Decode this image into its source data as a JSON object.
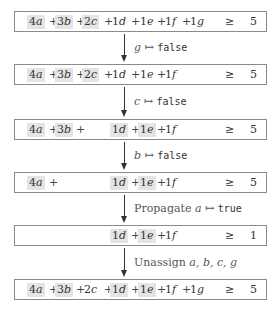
{
  "colors": {
    "highlight": "#e4e4e4",
    "border": "#8a8a8a"
  },
  "constraints": [
    {
      "terms": [
        {
          "coef": "4",
          "var": "a",
          "highlighted": true
        },
        {
          "coef": "3",
          "var": "b",
          "highlighted": true
        },
        {
          "coef": "2",
          "var": "c",
          "highlighted": true
        },
        {
          "coef": "1",
          "var": "d",
          "highlighted": false
        },
        {
          "coef": "1",
          "var": "e",
          "highlighted": false
        },
        {
          "coef": "1",
          "var": "f",
          "highlighted": false
        },
        {
          "coef": "1",
          "var": "g",
          "highlighted": false
        }
      ],
      "relation": "≥",
      "rhs": "5"
    },
    {
      "terms": [
        {
          "coef": "4",
          "var": "a",
          "highlighted": true
        },
        {
          "coef": "3",
          "var": "b",
          "highlighted": true
        },
        {
          "coef": "2",
          "var": "c",
          "highlighted": true
        },
        {
          "coef": "1",
          "var": "d",
          "highlighted": false
        },
        {
          "coef": "1",
          "var": "e",
          "highlighted": false
        },
        {
          "coef": "1",
          "var": "f",
          "highlighted": false
        }
      ],
      "relation": "≥",
      "rhs": "5"
    },
    {
      "terms": [
        {
          "coef": "4",
          "var": "a",
          "highlighted": true
        },
        {
          "coef": "3",
          "var": "b",
          "highlighted": true
        },
        {
          "coef": "1",
          "var": "d",
          "highlighted": true
        },
        {
          "coef": "1",
          "var": "e",
          "highlighted": true
        },
        {
          "coef": "1",
          "var": "f",
          "highlighted": false
        }
      ],
      "relation": "≥",
      "rhs": "5"
    },
    {
      "terms": [
        {
          "coef": "4",
          "var": "a",
          "highlighted": true
        },
        {
          "coef": "1",
          "var": "d",
          "highlighted": true
        },
        {
          "coef": "1",
          "var": "e",
          "highlighted": true
        },
        {
          "coef": "1",
          "var": "f",
          "highlighted": false
        }
      ],
      "relation": "≥",
      "rhs": "5"
    },
    {
      "terms": [
        {
          "coef": "1",
          "var": "d",
          "highlighted": true
        },
        {
          "coef": "1",
          "var": "e",
          "highlighted": true
        },
        {
          "coef": "1",
          "var": "f",
          "highlighted": false
        }
      ],
      "relation": "≥",
      "rhs": "1"
    },
    {
      "terms": [
        {
          "coef": "4",
          "var": "a",
          "highlighted": true
        },
        {
          "coef": "3",
          "var": "b",
          "highlighted": true
        },
        {
          "coef": "2",
          "var": "c",
          "highlighted": false
        },
        {
          "coef": "1",
          "var": "d",
          "highlighted": true
        },
        {
          "coef": "1",
          "var": "e",
          "highlighted": true
        },
        {
          "coef": "1",
          "var": "f",
          "highlighted": false
        },
        {
          "coef": "1",
          "var": "g",
          "highlighted": false
        }
      ],
      "relation": "≥",
      "rhs": "5"
    }
  ],
  "steps": [
    {
      "prefix": "",
      "var": "g",
      "mapsto": "↦",
      "value": "false"
    },
    {
      "prefix": "",
      "var": "c",
      "mapsto": "↦",
      "value": "false"
    },
    {
      "prefix": "",
      "var": "b",
      "mapsto": "↦",
      "value": "false"
    },
    {
      "prefix": "Propagate",
      "var": "a",
      "mapsto": "↦",
      "value": "true"
    },
    {
      "prefix": "Unassign",
      "var": "a, b, c, g",
      "mapsto": "",
      "value": ""
    }
  ]
}
